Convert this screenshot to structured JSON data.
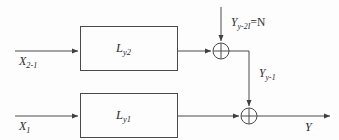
{
  "diagram": {
    "background_color": "#fdfdfd",
    "line_color": "#4a4a4a",
    "text_color": "#2b2b2b",
    "blocks": [
      {
        "id": "block-top",
        "label_main": "L",
        "label_sub": "y2",
        "label_full": "Ly2"
      },
      {
        "id": "block-bottom",
        "label_main": "L",
        "label_sub": "y1",
        "label_full": "Ly1"
      }
    ],
    "inputs": [
      {
        "id": "input-top",
        "label_main": "X",
        "label_sub": "2-1",
        "label_full": "X2-1"
      },
      {
        "id": "input-bottom",
        "label_main": "X",
        "label_sub": "1",
        "label_full": "X1"
      }
    ],
    "signals": [
      {
        "id": "noise-input",
        "label_main": "Y",
        "label_sub": "y-2I",
        "label_eq": "=N",
        "label_full": "Yy-2I=N"
      },
      {
        "id": "intermediate",
        "label_main": "Y",
        "label_sub": "y-1",
        "label_full": "Yy-1"
      }
    ],
    "outputs": [
      {
        "id": "output",
        "label_main": "Y",
        "label_sub": "",
        "label_full": "Y"
      }
    ],
    "junctions": [
      {
        "id": "sum-top",
        "symbol": "circle-plus",
        "cx": 221,
        "cy": 51,
        "r": 8
      },
      {
        "id": "sum-bottom",
        "symbol": "circle-plus",
        "cx": 249,
        "cy": 116,
        "r": 8
      }
    ]
  }
}
